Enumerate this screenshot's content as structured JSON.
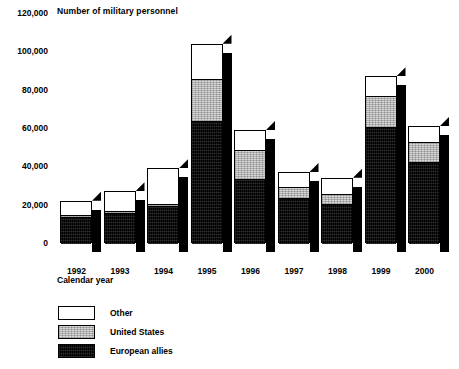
{
  "chart_data": {
    "type": "bar",
    "subtype": "stacked-3d-column",
    "title": "Number of military personnel",
    "xlabel": "Calendar year",
    "ylabel": "",
    "categories": [
      "1992",
      "1993",
      "1994",
      "1995",
      "1996",
      "1997",
      "1998",
      "1999",
      "2000"
    ],
    "series": [
      {
        "name": "European allies",
        "color": "#000000",
        "values": [
          14000,
          16000,
          20000,
          64000,
          34000,
          24000,
          21000,
          61000,
          43000
        ]
      },
      {
        "name": "United States",
        "color": "#d8d8d8",
        "values": [
          1000,
          1000,
          1000,
          22000,
          15000,
          6000,
          5000,
          16000,
          10000
        ]
      },
      {
        "name": "Other",
        "color": "#ffffff",
        "values": [
          7000,
          10000,
          18000,
          18000,
          10000,
          7000,
          8000,
          10000,
          8000
        ]
      }
    ],
    "totals": [
      22000,
      27000,
      39000,
      104000,
      59000,
      37000,
      34000,
      87000,
      61000
    ],
    "ylim": [
      0,
      120000
    ],
    "ytick_values": [
      120000,
      100000,
      80000,
      60000,
      40000,
      20000,
      0
    ],
    "ytick_labels": [
      "120,000",
      "100,000",
      "80,000",
      "60,000",
      "40,000",
      "20,000",
      "0"
    ],
    "grid": false,
    "legend_position": "bottom-left",
    "legend_order": [
      "Other",
      "United States",
      "European allies"
    ]
  },
  "legend": {
    "items": [
      {
        "label": "Other",
        "swatch": "white-swatch"
      },
      {
        "label": "United States",
        "swatch": "gray-swatch"
      },
      {
        "label": "European allies",
        "swatch": "black-swatch"
      }
    ]
  }
}
